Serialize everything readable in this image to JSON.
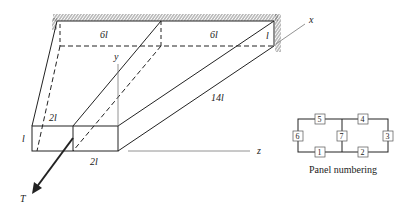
{
  "structure": {
    "dimensions": {
      "top_left_width": "6l",
      "top_right_width": "6l",
      "right_height": "l",
      "length": "14l",
      "front_height": "l",
      "front_top_width": "2l",
      "front_bottom_width": "2l"
    },
    "axes": {
      "x": "x",
      "y": "y",
      "z": "z"
    },
    "load": "T"
  },
  "panel_numbering": {
    "caption": "Panel numbering",
    "panels": [
      "1",
      "2",
      "3",
      "4",
      "5",
      "6",
      "7"
    ]
  },
  "colors": {
    "line": "#222222",
    "hatch": "#555555",
    "axis": "#777777"
  }
}
